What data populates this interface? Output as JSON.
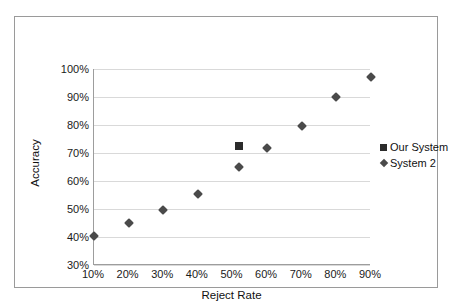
{
  "chart_data": {
    "type": "scatter",
    "title": "",
    "xlabel": "Reject Rate",
    "ylabel": "Accuracy",
    "xlim": [
      10,
      90
    ],
    "ylim": [
      30,
      100
    ],
    "xticks": [
      "10%",
      "20%",
      "30%",
      "40%",
      "50%",
      "60%",
      "70%",
      "80%",
      "90%"
    ],
    "xtick_values": [
      10,
      20,
      30,
      40,
      50,
      60,
      70,
      80,
      90
    ],
    "yticks": [
      "30%",
      "40%",
      "50%",
      "60%",
      "70%",
      "80%",
      "90%",
      "100%"
    ],
    "ytick_values": [
      30,
      40,
      50,
      60,
      70,
      80,
      90,
      100
    ],
    "grid": "horizontal",
    "legend_position": "right",
    "series": [
      {
        "name": "Our System",
        "marker": "square",
        "color": "#2b2b2b",
        "points": [
          {
            "x": 52,
            "y": 72.5
          }
        ]
      },
      {
        "name": "System 2",
        "marker": "diamond",
        "color": "#4a4a4a",
        "points": [
          {
            "x": 10,
            "y": 40.5
          },
          {
            "x": 20,
            "y": 45.0
          },
          {
            "x": 30,
            "y": 49.5
          },
          {
            "x": 40,
            "y": 55.5
          },
          {
            "x": 52,
            "y": 65.0
          },
          {
            "x": 60,
            "y": 71.8
          },
          {
            "x": 70,
            "y": 79.5
          },
          {
            "x": 80,
            "y": 90.0
          },
          {
            "x": 90,
            "y": 97.0
          }
        ]
      }
    ]
  }
}
